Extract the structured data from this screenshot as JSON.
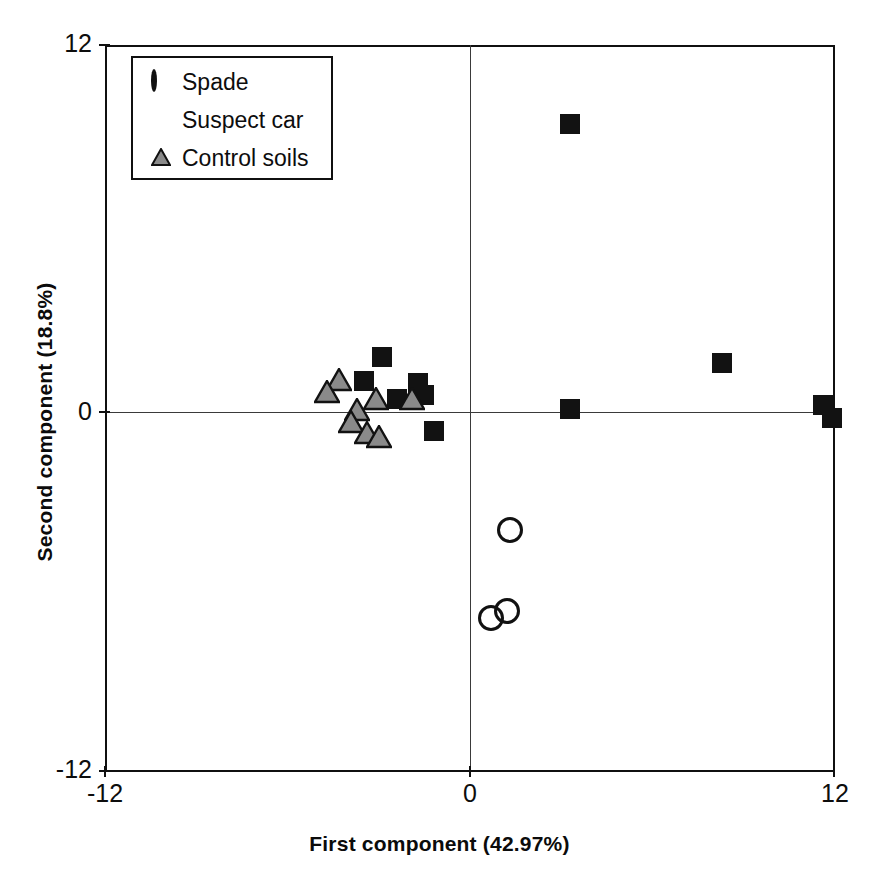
{
  "chart_data": {
    "type": "scatter",
    "title": "",
    "xlabel": "First component (42.97%)",
    "ylabel": "Second component (18.8%)",
    "xlim": [
      -12,
      12
    ],
    "ylim": [
      -12,
      12
    ],
    "xticks": [
      "-12",
      "0",
      "12"
    ],
    "yticks": [
      "-12",
      "0",
      "12"
    ],
    "xtick_values": [
      -12,
      0,
      12
    ],
    "ytick_values": [
      -12,
      0,
      12
    ],
    "grid": false,
    "zero_lines": true,
    "legend_position": "top-left",
    "legend": [
      {
        "label": "Spade",
        "marker": "circle-open",
        "color": "#111111"
      },
      {
        "label": "Suspect car",
        "marker": "square-filled",
        "color": "#111111"
      },
      {
        "label": "Control soils",
        "marker": "triangle-gray",
        "color": "#8a8a8a"
      }
    ],
    "series": [
      {
        "name": "Spade",
        "marker": "circle-open",
        "color": "#111111",
        "points": [
          {
            "x": 1.3,
            "y": -4.0
          },
          {
            "x": 0.7,
            "y": -6.9
          },
          {
            "x": 1.2,
            "y": -6.7
          }
        ]
      },
      {
        "name": "Suspect car",
        "marker": "square-filled",
        "color": "#121212",
        "points": [
          {
            "x": 3.3,
            "y": 9.4
          },
          {
            "x": 8.3,
            "y": 1.5
          },
          {
            "x": 11.6,
            "y": 0.1
          },
          {
            "x": 11.9,
            "y": -0.3
          },
          {
            "x": 3.3,
            "y": -0.02
          },
          {
            "x": -2.9,
            "y": 1.7
          },
          {
            "x": -3.5,
            "y": 0.9
          },
          {
            "x": -1.7,
            "y": 0.85
          },
          {
            "x": -1.5,
            "y": 0.45
          },
          {
            "x": -2.4,
            "y": 0.3
          },
          {
            "x": -1.2,
            "y": -0.75
          }
        ]
      },
      {
        "name": "Control soils",
        "marker": "triangle-gray",
        "color": "#8a8a8a",
        "points": [
          {
            "x": -4.3,
            "y": 0.95
          },
          {
            "x": -4.7,
            "y": 0.55
          },
          {
            "x": -3.1,
            "y": 0.3
          },
          {
            "x": -1.9,
            "y": 0.3
          },
          {
            "x": -3.7,
            "y": -0.05
          },
          {
            "x": -3.9,
            "y": -0.45
          },
          {
            "x": -3.4,
            "y": -0.8
          },
          {
            "x": -3.0,
            "y": -0.95
          }
        ]
      }
    ]
  },
  "axes": {
    "x_title": "First component (42.97%)",
    "y_title": "Second component (18.8%)",
    "x_min_label": "-12",
    "x_mid_label": "0",
    "x_max_label": "12",
    "y_min_label": "-12",
    "y_mid_label": "0",
    "y_max_label": "12"
  },
  "legend": {
    "items": [
      {
        "label": "Spade"
      },
      {
        "label": "Suspect car"
      },
      {
        "label": "Control soils"
      }
    ]
  }
}
